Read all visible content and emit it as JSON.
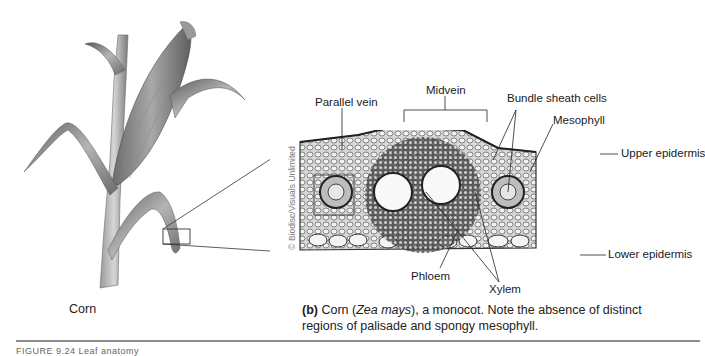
{
  "plant": {
    "caption": "Corn"
  },
  "micrograph": {
    "credit": "© Biodisc/Visuals Unlimited",
    "labels": {
      "parallel_vein": "Parallel vein",
      "midvein": "Midvein",
      "bundle_sheath": "Bundle sheath cells",
      "mesophyll": "Mesophyll",
      "upper_epidermis": "Upper epidermis",
      "lower_epidermis": "Lower epidermis",
      "phloem": "Phloem",
      "xylem": "Xylem"
    }
  },
  "caption": {
    "part": "(b)",
    "text_before_italic": " Corn (",
    "italic": "Zea mays",
    "text_after_italic": "), a monocot. Note the absence of distinct regions of palisade and spongy mesophyll."
  },
  "figure_label": "FIGURE 9.24 Leaf anatomy"
}
